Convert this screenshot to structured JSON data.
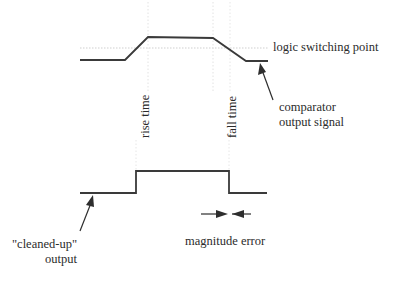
{
  "diagram": {
    "title": "",
    "labels": {
      "threshold": "logic switching point",
      "comparator_line1": "comparator",
      "comparator_line2": "output signal",
      "rise_time": "rise time",
      "fall_time": "fall time",
      "cleaned_line1": "\"cleaned-up\"",
      "cleaned_line2": "output",
      "magnitude_error": "magnitude error"
    },
    "colors": {
      "line": "#3a3a3a",
      "guide": "#d8d8d8",
      "text": "#2b2b2b"
    },
    "waveforms": {
      "comparator_output": [
        [
          80,
          60
        ],
        [
          125,
          60
        ],
        [
          148,
          37
        ],
        [
          213,
          38
        ],
        [
          246,
          61
        ],
        [
          268,
          61
        ]
      ],
      "cleaned_output": [
        [
          80,
          193
        ],
        [
          136,
          193
        ],
        [
          136,
          171
        ],
        [
          229,
          171
        ],
        [
          229,
          193
        ],
        [
          267,
          193
        ]
      ]
    },
    "threshold_y": 48
  }
}
